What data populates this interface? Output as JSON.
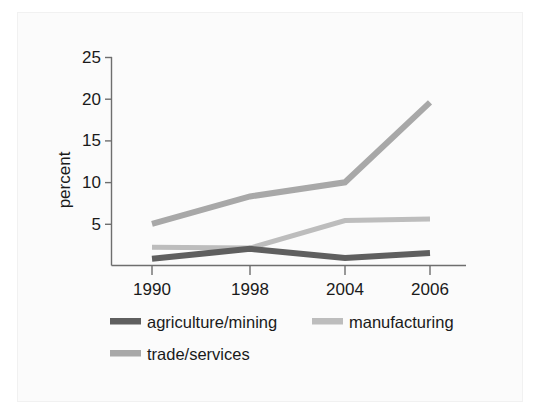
{
  "chart_data": {
    "type": "line",
    "title": "",
    "subtitle": "",
    "xlabel": "",
    "ylabel": "percent",
    "categories": [
      "1990",
      "1998",
      "2004",
      "2006"
    ],
    "x": [
      1990,
      1998,
      2004,
      2006
    ],
    "ylim": [
      0,
      25
    ],
    "yticks": [
      0,
      5,
      10,
      15,
      20,
      25
    ],
    "ytick_labels": [
      "0",
      "5",
      "10",
      "15",
      "20",
      "25"
    ],
    "grid": false,
    "legend_position": "bottom",
    "series": [
      {
        "name": "agriculture/mining",
        "color": "#5f5f5f",
        "values": [
          0.8,
          2.0,
          0.9,
          1.5
        ]
      },
      {
        "name": "manufacturing",
        "color": "#bdbdbd",
        "values": [
          2.2,
          2.1,
          5.4,
          5.6
        ]
      },
      {
        "name": "trade/services",
        "color": "#a8a8a8",
        "values": [
          5.0,
          8.3,
          10.0,
          19.6
        ]
      }
    ]
  },
  "legend": {
    "entries": [
      {
        "label": "agriculture/mining",
        "color": "#5f5f5f"
      },
      {
        "label": "manufacturing",
        "color": "#bdbdbd"
      },
      {
        "label": "trade/services",
        "color": "#a8a8a8"
      }
    ]
  },
  "axes": {
    "y_title": "percent",
    "y_tick_labels": [
      "25",
      "20",
      "15",
      "10",
      "5"
    ],
    "x_tick_labels": [
      "1990",
      "1998",
      "2004",
      "2006"
    ]
  }
}
